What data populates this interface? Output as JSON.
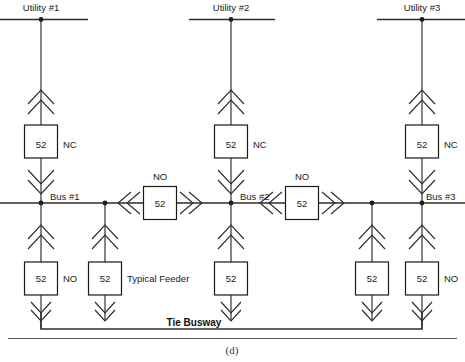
{
  "figure": {
    "caption": "(d)",
    "tie_busway_label": "Tie Busway"
  },
  "sources": [
    {
      "id": "utility-1",
      "label": "Utility #1",
      "x": 41
    },
    {
      "id": "utility-2",
      "label": "Utility #2",
      "x": 231
    },
    {
      "id": "utility-3",
      "label": "Utility #3",
      "x": 422
    }
  ],
  "buses": [
    {
      "id": "bus-1",
      "label": "Bus #1",
      "x": 41
    },
    {
      "id": "bus-2",
      "label": "Bus #2",
      "x": 231
    },
    {
      "id": "bus-3",
      "label": "Bus #3",
      "x": 422
    }
  ],
  "main_breakers": [
    {
      "id": "main-breaker-1",
      "number": "52",
      "state": "NC",
      "x": 41
    },
    {
      "id": "main-breaker-2",
      "number": "52",
      "state": "NC",
      "x": 231
    },
    {
      "id": "main-breaker-3",
      "number": "52",
      "state": "NC",
      "x": 422
    }
  ],
  "tie_breakers": [
    {
      "id": "tie-breaker-1",
      "number": "52",
      "state": "NO",
      "x": 160
    },
    {
      "id": "tie-breaker-2",
      "number": "52",
      "state": "NO",
      "x": 302
    }
  ],
  "feeder_breakers": [
    {
      "id": "feeder-breaker-1",
      "number": "52",
      "state": "NO",
      "annotation": "NO",
      "x": 41
    },
    {
      "id": "feeder-breaker-2",
      "number": "52",
      "state": "",
      "annotation": "Typical Feeder",
      "x": 105
    },
    {
      "id": "feeder-breaker-3",
      "number": "52",
      "state": "",
      "annotation": "",
      "x": 231
    },
    {
      "id": "feeder-breaker-4",
      "number": "52",
      "state": "",
      "annotation": "",
      "x": 372
    },
    {
      "id": "feeder-breaker-5",
      "number": "52",
      "state": "NO",
      "annotation": "NO",
      "x": 422
    }
  ],
  "colors": {
    "line": "#2b2b2b",
    "text": "#1a1a1a",
    "background": "#ffffff"
  }
}
